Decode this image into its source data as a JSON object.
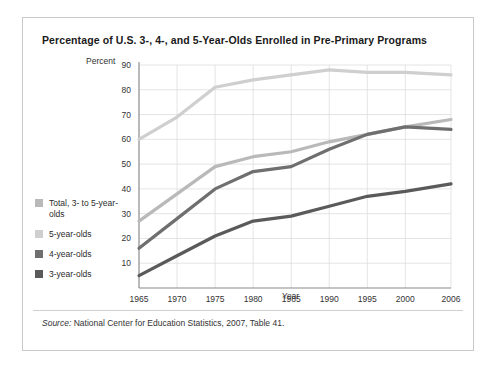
{
  "card": {
    "title": "Percentage of U.S. 3-, 4-, and 5-Year-Olds Enrolled in Pre-Primary Programs",
    "source_label": "Source:",
    "source_text": " National Center for Education Statistics, 2007, Table 41."
  },
  "legend": {
    "items": [
      {
        "label": "Total, 3- to 5-year-olds",
        "color": "#b9b9b9",
        "key": "total"
      },
      {
        "label": "5-year-olds",
        "color": "#cfcfcf",
        "key": "five"
      },
      {
        "label": "4-year-olds",
        "color": "#6f6f6f",
        "key": "four"
      },
      {
        "label": "3-year-olds",
        "color": "#5a5a5a",
        "key": "three"
      }
    ]
  },
  "chart_data": {
    "type": "line",
    "title": "Percentage of U.S. 3-, 4-, and 5-Year-Olds Enrolled in Pre-Primary Programs",
    "xlabel": "Year",
    "ylabel": "Percent",
    "ylim": [
      0,
      90
    ],
    "xlim": [
      1965,
      2006
    ],
    "yticks": [
      10,
      20,
      30,
      40,
      50,
      60,
      70,
      80,
      90
    ],
    "xticks": [
      1965,
      1970,
      1975,
      1980,
      1985,
      1990,
      1995,
      2000,
      2006
    ],
    "grid": true,
    "legend_position": "left",
    "x": [
      1965,
      1970,
      1975,
      1980,
      1985,
      1990,
      1995,
      2000,
      2006
    ],
    "series": [
      {
        "name": "5-year-olds",
        "color": "#cfcfcf",
        "values": [
          60,
          69,
          81,
          84,
          86,
          88,
          87,
          87,
          86
        ]
      },
      {
        "name": "Total, 3- to 5-year-olds",
        "color": "#b9b9b9",
        "values": [
          27,
          38,
          49,
          53,
          55,
          59,
          62,
          65,
          68
        ]
      },
      {
        "name": "4-year-olds",
        "color": "#6f6f6f",
        "values": [
          16,
          28,
          40,
          47,
          49,
          56,
          62,
          65,
          64
        ]
      },
      {
        "name": "3-year-olds",
        "color": "#5a5a5a",
        "values": [
          5,
          13,
          21,
          27,
          29,
          33,
          37,
          39,
          42
        ]
      }
    ]
  }
}
